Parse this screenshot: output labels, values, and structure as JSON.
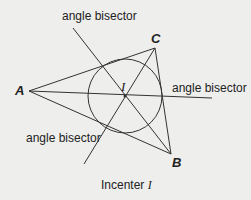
{
  "labels": {
    "bisector_top": "angle bisector",
    "bisector_right": "angle bisector",
    "bisector_left": "angle bisector",
    "caption_text": "Incenter ",
    "caption_var": "I"
  },
  "points": {
    "A": "A",
    "B": "B",
    "C": "C",
    "I": "I"
  },
  "colors": {
    "background": "#eeeeec",
    "stroke": "#333333"
  }
}
